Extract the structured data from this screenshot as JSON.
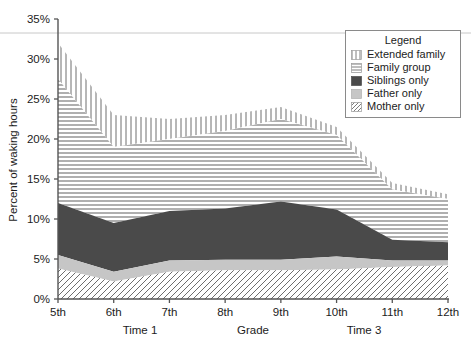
{
  "chart_data": {
    "type": "area",
    "title": "",
    "subtitle": "",
    "xlabel": "Grade",
    "ylabel": "Percent of waking hours",
    "xlim": [
      5,
      12
    ],
    "ylim": [
      0,
      35
    ],
    "grid": false,
    "stacked": true,
    "legend_position": "top-right",
    "legend_title": "Legend",
    "categories": [
      "5th",
      "6th",
      "7th",
      "8th",
      "9th",
      "10th",
      "11th",
      "12th"
    ],
    "x": [
      5,
      6,
      7,
      8,
      9,
      10,
      11,
      12
    ],
    "xtick_labels": [
      "5th",
      "6th",
      "7th",
      "8th",
      "9th",
      "10th",
      "11th",
      "12th"
    ],
    "ytick_labels": [
      "0%",
      "5%",
      "10%",
      "15%",
      "20%",
      "25%",
      "30%",
      "35%"
    ],
    "ytick_values": [
      0,
      5,
      10,
      15,
      20,
      25,
      30,
      35
    ],
    "x_secondary_labels": [
      "Time 1",
      "Grade",
      "Time 3"
    ],
    "series": [
      {
        "name": "Mother only",
        "pattern": "diagonal-lines",
        "color": "#ffffff",
        "values": [
          3.8,
          2.2,
          3.4,
          3.6,
          3.6,
          3.7,
          4.0,
          4.2
        ]
      },
      {
        "name": "Father only",
        "pattern": "solid-light-gray",
        "color": "#c6c6c6",
        "values": [
          1.7,
          1.2,
          1.4,
          1.3,
          1.3,
          1.6,
          0.8,
          0.6
        ]
      },
      {
        "name": "Siblings only",
        "pattern": "solid-dark-gray",
        "color": "#4a4a4a",
        "values": [
          6.5,
          6.1,
          6.2,
          6.4,
          7.3,
          5.9,
          2.6,
          2.3
        ]
      },
      {
        "name": "Family group",
        "pattern": "horizontal-lines",
        "color": "#ffffff",
        "values": [
          15.5,
          9.5,
          9.0,
          9.7,
          10.3,
          9.3,
          6.3,
          5.4
        ]
      },
      {
        "name": "Extended family",
        "pattern": "vertical-lines",
        "color": "#ffffff",
        "values": [
          4.5,
          4.0,
          2.5,
          2.0,
          1.5,
          1.0,
          0.8,
          0.6
        ]
      }
    ],
    "series_tops_cumulative": {
      "mother_only": [
        3.8,
        2.2,
        3.4,
        3.6,
        3.6,
        3.7,
        4.0,
        4.2
      ],
      "father_only": [
        5.5,
        3.4,
        4.8,
        4.9,
        4.9,
        5.3,
        4.8,
        4.8
      ],
      "siblings_only": [
        12.0,
        9.5,
        11.0,
        11.3,
        12.2,
        11.2,
        7.4,
        7.1
      ],
      "family_group": [
        27.5,
        19.0,
        20.0,
        21.0,
        22.5,
        20.5,
        13.7,
        12.5
      ],
      "extended_family": [
        32.0,
        23.0,
        22.5,
        23.0,
        24.0,
        21.5,
        14.5,
        13.1
      ]
    },
    "legend_entries": [
      {
        "label": "Extended family",
        "pattern": "vertical-lines"
      },
      {
        "label": "Family group",
        "pattern": "horizontal-lines"
      },
      {
        "label": "Siblings only",
        "pattern": "solid-dark-gray"
      },
      {
        "label": "Father only",
        "pattern": "solid-light-gray"
      },
      {
        "label": "Mother only",
        "pattern": "diagonal-lines"
      }
    ]
  },
  "colors": {
    "axis": "#555555",
    "text": "#1c1c1c",
    "siblings": "#4a4a4a",
    "father": "#c6c6c6",
    "hatch_stroke": "#6e6e6e",
    "legend_border": "#8a8a8a",
    "top_rule": "#c8c8c8"
  }
}
